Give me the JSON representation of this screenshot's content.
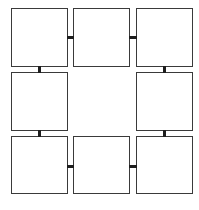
{
  "diagram": {
    "title": "",
    "colors": {
      "border": "#3a3a3a",
      "connector": "#1e1e1e",
      "background": "#ffffff"
    },
    "nodes": [
      {
        "id": "top-left",
        "label": ""
      },
      {
        "id": "top-center",
        "label": ""
      },
      {
        "id": "top-right",
        "label": ""
      },
      {
        "id": "middle-left",
        "label": ""
      },
      {
        "id": "middle-right",
        "label": ""
      },
      {
        "id": "bottom-left",
        "label": ""
      },
      {
        "id": "bottom-center",
        "label": ""
      },
      {
        "id": "bottom-right",
        "label": ""
      }
    ],
    "edges": [
      [
        "top-left",
        "top-center"
      ],
      [
        "top-center",
        "top-right"
      ],
      [
        "top-right",
        "middle-right"
      ],
      [
        "middle-right",
        "bottom-right"
      ],
      [
        "bottom-right",
        "bottom-center"
      ],
      [
        "bottom-center",
        "bottom-left"
      ],
      [
        "bottom-left",
        "middle-left"
      ],
      [
        "middle-left",
        "top-left"
      ]
    ]
  }
}
